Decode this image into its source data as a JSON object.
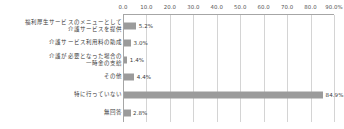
{
  "chart_data": {
    "type": "bar",
    "orientation": "horizontal",
    "title": "",
    "xlabel": "",
    "ylabel": "",
    "xlim": [
      0.0,
      90.0
    ],
    "grid": true,
    "legend": false,
    "axis_position": "top",
    "bar_color": "#9b9b9b",
    "gridline_color": "#d4d4d4",
    "axis_color": "#a6a6a6",
    "tick_labels": [
      "0.0",
      "10.0",
      "20.0",
      "30.0",
      "40.0",
      "50.0",
      "60.0",
      "70.0",
      "80.0",
      "90.0%"
    ],
    "tick_values": [
      0,
      10,
      20,
      30,
      40,
      50,
      60,
      70,
      80,
      90
    ],
    "categories": [
      "福利厚生サービスのメニューとして\n介護サービスを提供",
      "介護サービス利用料の助成",
      "介護が必要となった場合の\n一時金の支給",
      "その他",
      "特に行っていない",
      "無回答"
    ],
    "values": [
      5.2,
      3.0,
      1.4,
      4.4,
      84.9,
      2.8
    ],
    "value_labels": [
      "5.2%",
      "3.0%",
      "1.4%",
      "4.4%",
      "84.9%",
      "2.8%"
    ]
  }
}
